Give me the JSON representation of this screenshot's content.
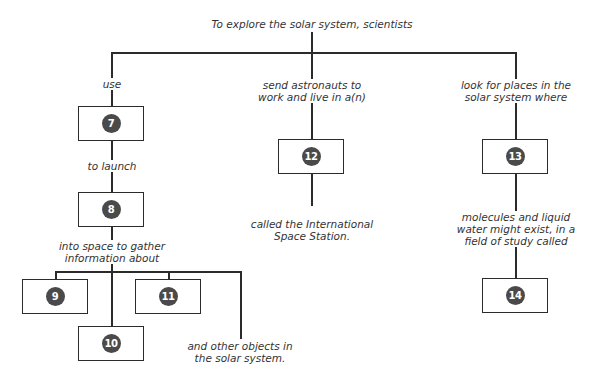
{
  "diagram": {
    "root": "To explore the solar system, scientists",
    "branches": {
      "left": {
        "link1": "use",
        "box1": "7",
        "link2": "to launch",
        "box2": "8",
        "link3_line1": "into space to gather",
        "link3_line2": "information about",
        "boxes": [
          "9",
          "10",
          "11"
        ],
        "tail_line1": "and other objects in",
        "tail_line2": "the solar system."
      },
      "middle": {
        "link1_line1": "send astronauts to",
        "link1_line2": "work and live in a(n)",
        "box1": "12",
        "tail_line1": "called the International",
        "tail_line2": "Space Station."
      },
      "right": {
        "link1_line1": "look for places in the",
        "link1_line2": "solar system where",
        "box1": "13",
        "link2_line1": "molecules and liquid",
        "link2_line2": "water might exist, in a",
        "link2_line3": "field of study called",
        "box2": "14"
      }
    },
    "colors": {
      "line": "#2b2b2b",
      "badge": "#4a4a4a",
      "badge_text": "#ffffff"
    }
  }
}
